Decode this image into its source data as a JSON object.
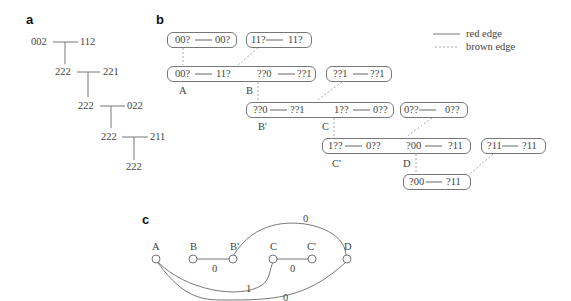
{
  "panels": {
    "a": {
      "label": "a",
      "nodes": [
        {
          "id": "n1",
          "text": "002"
        },
        {
          "id": "n2",
          "text": "112"
        },
        {
          "id": "n3",
          "text": "222"
        },
        {
          "id": "n4",
          "text": "221"
        },
        {
          "id": "n5",
          "text": "222"
        },
        {
          "id": "n6",
          "text": "022"
        },
        {
          "id": "n7",
          "text": "222"
        },
        {
          "id": "n8",
          "text": "211"
        },
        {
          "id": "n9",
          "text": "222"
        }
      ]
    },
    "b": {
      "label": "b",
      "legend": {
        "red_edge": "red edge",
        "brown_edge": "brown edge"
      },
      "boxes": [
        {
          "left": "00?",
          "right": "00?"
        },
        {
          "left": "11?",
          "right": "11?"
        },
        {
          "left": "00?",
          "right": "11?",
          "left2": "??0",
          "right2": "??1"
        },
        {
          "left": "??1",
          "right": "??1"
        },
        {
          "left": "??0",
          "right": "??1",
          "left2": "1??",
          "right2": "0??"
        },
        {
          "left": "0??",
          "right": "0??"
        },
        {
          "left": "1??",
          "right": "0??",
          "left2": "?00",
          "right2": "?11"
        },
        {
          "left": "?11",
          "right": "?11"
        },
        {
          "left": "?00",
          "right": "?11"
        }
      ],
      "markers": [
        "A",
        "B",
        "B'",
        "C",
        "C'",
        "D"
      ]
    },
    "c": {
      "label": "c",
      "nodes": [
        "A",
        "B",
        "B'",
        "C",
        "C'",
        "D"
      ],
      "edge_labels": {
        "B_Bp": "0",
        "C_Cp": "0",
        "Bp_D": "0",
        "A_C": "1",
        "A_D": "0"
      }
    }
  },
  "colors": {
    "line": "#777777",
    "dashed": "#aaaaaa",
    "text": "#444444"
  }
}
